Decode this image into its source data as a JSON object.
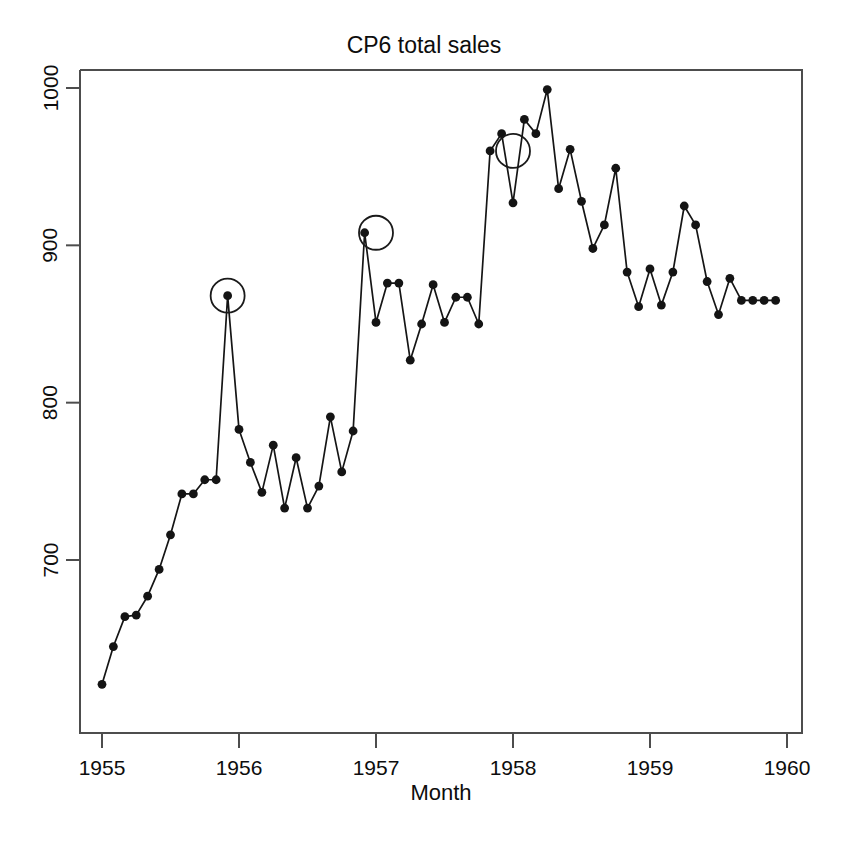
{
  "chart_data": {
    "type": "line",
    "title": "CP6 total sales",
    "xlabel": "Month",
    "ylabel": "",
    "xlim": [
      1955.0,
      1960.0
    ],
    "ylim": [
      620,
      1010
    ],
    "grid": false,
    "legend": null,
    "xticks": [
      "1955",
      "1956",
      "1957",
      "1958",
      "1959",
      "1960"
    ],
    "xtick_values": [
      1955,
      1956,
      1957,
      1958,
      1959,
      1960
    ],
    "yticks": [
      "700",
      "800",
      "900",
      "1000"
    ],
    "ytick_values": [
      700,
      800,
      900,
      1000
    ],
    "marker": "filled-circle",
    "series": [
      {
        "name": "CP6 total sales",
        "x": [
          1955.0,
          1955.083,
          1955.167,
          1955.25,
          1955.333,
          1955.417,
          1955.5,
          1955.583,
          1955.667,
          1955.75,
          1955.833,
          1955.917,
          1956.0,
          1956.083,
          1956.167,
          1956.25,
          1956.333,
          1956.417,
          1956.5,
          1956.583,
          1956.667,
          1956.75,
          1956.833,
          1956.917,
          1957.0,
          1957.083,
          1957.167,
          1957.25,
          1957.333,
          1957.417,
          1957.5,
          1957.583,
          1957.667,
          1957.75,
          1957.833,
          1957.917,
          1958.0,
          1958.083,
          1958.167,
          1958.25,
          1958.333,
          1958.417,
          1958.5,
          1958.583,
          1958.667,
          1958.75,
          1958.833,
          1958.917,
          1959.0,
          1959.083,
          1959.167,
          1959.25,
          1959.333,
          1959.417,
          1959.5,
          1959.583,
          1959.667,
          1959.75,
          1959.833,
          1959.917
        ],
        "values": [
          621,
          645,
          664,
          665,
          677,
          694,
          716,
          742,
          742,
          751,
          751,
          868,
          783,
          762,
          743,
          773,
          733,
          765,
          733,
          747,
          791,
          756,
          782,
          908,
          851,
          876,
          876,
          827,
          850,
          875,
          851,
          867,
          867,
          850,
          960,
          971,
          927,
          980,
          971,
          999,
          936,
          961,
          928,
          898,
          913,
          949,
          883,
          861,
          885,
          862,
          883,
          925,
          913,
          877,
          856,
          879,
          865,
          865,
          865,
          865
        ]
      }
    ],
    "annotations": {
      "type": "highlight-circles",
      "description": "Open circles marking outlier points",
      "points": [
        {
          "x": 1955.917,
          "y": 868
        },
        {
          "x": 1957.0,
          "y": 908
        },
        {
          "x": 1958.0,
          "y": 960
        }
      ]
    }
  }
}
